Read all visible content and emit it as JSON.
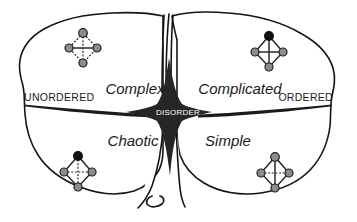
{
  "diagram": {
    "background_color": "#ffffff",
    "ink_color": "#141414",
    "center": {
      "label": "DISORDER",
      "text_color": "#ffffff",
      "shape_color": "#262626"
    },
    "axis_labels": {
      "left": "UNORDERED",
      "right": "ORDERED"
    },
    "quadrants": [
      {
        "key": "complex",
        "label": "Complex",
        "position": "top-left",
        "icon": "tetrahedron-dashed-gray-icon",
        "icon_top_node_color": "#8c8c8c",
        "icon_edge_style": "dashed"
      },
      {
        "key": "complicated",
        "label": "Complicated",
        "position": "top-right",
        "icon": "tetrahedron-solid-black-icon",
        "icon_top_node_color": "#111111",
        "icon_edge_style": "solid"
      },
      {
        "key": "chaotic",
        "label": "Chaotic",
        "position": "bottom-left",
        "icon": "tetrahedron-dashed-black-icon",
        "icon_top_node_color": "#111111",
        "icon_edge_style": "dashed"
      },
      {
        "key": "simple",
        "label": "Simple",
        "position": "bottom-right",
        "icon": "tetrahedron-solid-gray-icon",
        "icon_top_node_color": "#8c8c8c",
        "icon_edge_style": "solid"
      }
    ]
  }
}
